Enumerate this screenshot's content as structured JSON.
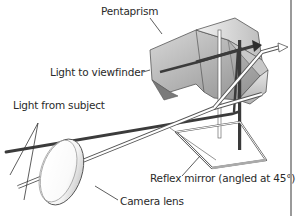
{
  "diagram": {
    "labels": {
      "pentaprism": "Pentaprism",
      "light_to_viewfinder": "Light to viewfinder",
      "light_from_subject": "Light from subject",
      "reflex_mirror": "Reflex mirror (angled at 45°)",
      "camera_lens": "Camera lens"
    },
    "colors": {
      "background": "#ffffff",
      "text": "#2a2a2a",
      "light_ray_dark": "#3a3a3a",
      "outline": "#444444",
      "prism_fill_light": "#e6e6e6",
      "prism_fill_dark": "#9c9c9c",
      "edge_rule": "#9a9a9a"
    }
  }
}
